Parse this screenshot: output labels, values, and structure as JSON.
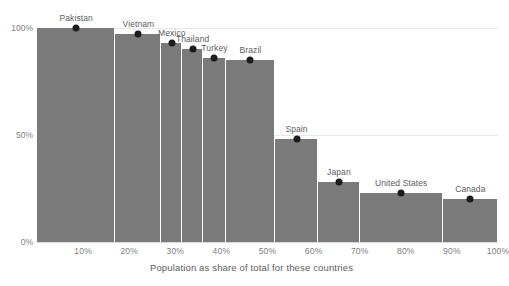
{
  "chart_data": {
    "type": "bar",
    "title": "",
    "subtitle": "",
    "xlabel": "Population as share of total for these countries",
    "ylabel": "",
    "xlim": [
      0,
      100
    ],
    "ylim": [
      0,
      100
    ],
    "grid": true,
    "legend": null,
    "variable_width": true,
    "x_unit": "%",
    "y_unit": "%",
    "note": "Marimekko-style chart: bar width = cumulative population share, dot/bar height = value in percent",
    "categories": [
      "Pakistan",
      "Vietnam",
      "Mexico",
      "Thailand",
      "Turkey",
      "Brazil",
      "Spain",
      "Japan",
      "United States",
      "Canada"
    ],
    "values": [
      100,
      97,
      93,
      90,
      86,
      85,
      48,
      28,
      23,
      20
    ],
    "widths": [
      17.0,
      10.0,
      4.5,
      4.5,
      5.0,
      10.6,
      9.4,
      9.0,
      18.0,
      12.0
    ],
    "x_start": [
      0,
      17.0,
      27.0,
      31.5,
      36.0,
      41.0,
      51.6,
      61.0,
      70.0,
      88.0
    ],
    "x_end": [
      17.0,
      27.0,
      31.5,
      36.0,
      41.0,
      51.6,
      61.0,
      70.0,
      88.0,
      100.0
    ],
    "xticks": [
      "10%",
      "20%",
      "30%",
      "40%",
      "50%",
      "60%",
      "70%",
      "80%",
      "90%",
      "100%"
    ],
    "xtick_values": [
      10,
      20,
      30,
      40,
      50,
      60,
      70,
      80,
      90,
      100
    ],
    "yticks": [
      "0%",
      "50%",
      "100%"
    ],
    "ytick_values": [
      0,
      50,
      100
    ],
    "colors": {
      "bar": "#7a7a7a",
      "dot": "#1c1c1c",
      "grid": "#e8e8e8",
      "text": "#5d5d5d",
      "tick_text": "#808080",
      "background": "#ffffff"
    }
  }
}
